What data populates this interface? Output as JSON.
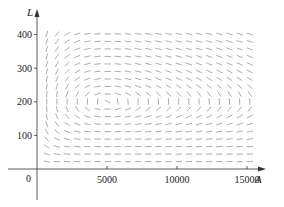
{
  "chart_data": {
    "type": "slope_field",
    "title": "",
    "xlabel": "A",
    "ylabel": "L",
    "origin_label": "0",
    "xticks": [
      5000,
      10000,
      15000
    ],
    "xtick_labels": [
      "5000",
      "10000",
      "15000"
    ],
    "yticks": [
      100,
      200,
      300,
      400
    ],
    "ytick_labels": [
      "100",
      "200",
      "300",
      "400"
    ],
    "xlim": [
      0,
      16500
    ],
    "ylim": [
      -90,
      470
    ],
    "grid": false,
    "system": {
      "description": "Predator-prey direction field (aphids A, ladybugs L)",
      "dA_dt": "2A - 0.01AL",
      "dL_dt": "-0.5L + 0.0001AL",
      "coefficients": {
        "a": 2,
        "b": 0.01,
        "c": 0.5,
        "d": 0.0001
      }
    },
    "equilibrium": {
      "A": 5000,
      "L": 200
    },
    "field_grid": {
      "A_start": 700,
      "A_step": 725,
      "A_count": 21,
      "L_start": 22,
      "L_step": 22.35,
      "L_count": 18
    },
    "colors": {
      "axis": "#333333",
      "segment": "#8a8a8a",
      "text": "#222222"
    }
  }
}
